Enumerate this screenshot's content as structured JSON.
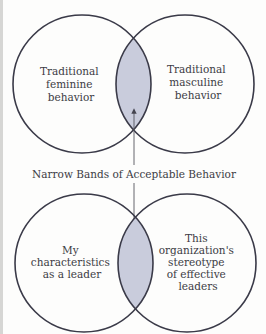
{
  "colors": {
    "background": "#fdfdfc",
    "stroke": "#3a3a48",
    "overlap_fill": "#c9ccdc",
    "text": "#3c3c44",
    "arrow": "#55555f"
  },
  "top_diagram": {
    "left_circle": {
      "lines": [
        "Traditional",
        "feminine",
        "behavior"
      ]
    },
    "right_circle": {
      "lines": [
        "Traditional",
        "masculine",
        "behavior"
      ]
    }
  },
  "center_label": "Narrow Bands of Acceptable Behavior",
  "bottom_diagram": {
    "left_circle": {
      "lines": [
        "My",
        "characteristics",
        "as a leader"
      ]
    },
    "right_circle": {
      "lines": [
        "This",
        "organization's",
        "stereotype",
        "of effective",
        "leaders"
      ]
    }
  }
}
